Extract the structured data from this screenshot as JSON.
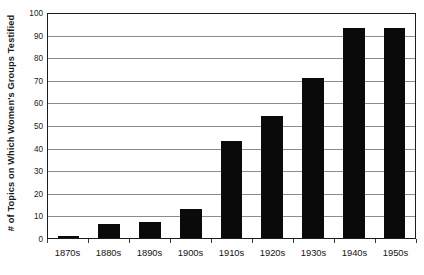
{
  "chart_data": {
    "type": "bar",
    "title": "",
    "xlabel": "",
    "ylabel": "# of Topics on Which Women's Groups Testified",
    "categories": [
      "1870s",
      "1880s",
      "1890s",
      "1900s",
      "1910s",
      "1920s",
      "1930s",
      "1940s",
      "1950s"
    ],
    "values": [
      1,
      6,
      7,
      13,
      43,
      54,
      71,
      93,
      93
    ],
    "ylim": [
      0,
      100
    ],
    "ytick_labels": [
      "0",
      "10",
      "20",
      "30",
      "40",
      "50",
      "60",
      "70",
      "80",
      "90",
      "100"
    ],
    "ytick_values": [
      0,
      10,
      20,
      30,
      40,
      50,
      60,
      70,
      80,
      90,
      100
    ],
    "grid": true,
    "legend": "none",
    "bar_color": "#0a0a0a",
    "grid_color": "#8c8c8c",
    "axis_color": "#1c1c1c",
    "background_color": "#ffffff"
  }
}
